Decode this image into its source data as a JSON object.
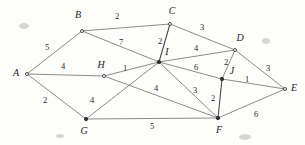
{
  "figure": {
    "width": 305,
    "height": 145,
    "background_color": "#fdfdfc",
    "edge_color": "#5a5a5a",
    "label_color": "#1c1c1c"
  },
  "chart_data": {
    "type": "diagram",
    "diagram_type": "weighted-undirected-graph",
    "title": "",
    "node_count": 10,
    "edge_count": 19,
    "nodes": [
      {
        "id": "A",
        "label": "A",
        "x": 27,
        "y": 74,
        "label_x": 16,
        "label_y": 74,
        "marker": "hollow"
      },
      {
        "id": "B",
        "label": "B",
        "x": 82,
        "y": 31,
        "label_x": 78,
        "label_y": 16,
        "marker": "hollow"
      },
      {
        "id": "C",
        "label": "C",
        "x": 170,
        "y": 24,
        "label_x": 172,
        "label_y": 12,
        "marker": "hollow"
      },
      {
        "id": "D",
        "label": "D",
        "x": 235,
        "y": 50,
        "label_x": 240,
        "label_y": 39,
        "marker": "hollow"
      },
      {
        "id": "E",
        "label": "E",
        "x": 285,
        "y": 89,
        "label_x": 294,
        "label_y": 89,
        "marker": "hollow"
      },
      {
        "id": "F",
        "label": "F",
        "x": 218,
        "y": 118,
        "label_x": 219,
        "label_y": 131,
        "marker": "solid"
      },
      {
        "id": "G",
        "label": "G",
        "x": 86,
        "y": 119,
        "label_x": 84,
        "label_y": 132,
        "marker": "solid"
      },
      {
        "id": "H",
        "label": "H",
        "x": 104,
        "y": 76,
        "label_x": 101,
        "label_y": 66,
        "marker": "hollow"
      },
      {
        "id": "I",
        "label": "I",
        "x": 159,
        "y": 62,
        "label_x": 167,
        "label_y": 53,
        "marker": "solid"
      },
      {
        "id": "J",
        "label": "J",
        "x": 222,
        "y": 79,
        "label_x": 232,
        "label_y": 72,
        "marker": "solid"
      }
    ],
    "edges": [
      {
        "from": "A",
        "to": "B",
        "weight": 5,
        "label_x": 47,
        "label_y": 48,
        "thick": false
      },
      {
        "from": "A",
        "to": "H",
        "weight": 4,
        "label_x": 63,
        "label_y": 67,
        "thick": false
      },
      {
        "from": "A",
        "to": "G",
        "weight": 2,
        "label_x": 45,
        "label_y": 101,
        "thick": false
      },
      {
        "from": "B",
        "to": "C",
        "weight": 2,
        "label_x": 117,
        "label_y": 17,
        "thick": false
      },
      {
        "from": "B",
        "to": "I",
        "weight": 7,
        "label_x": 121,
        "label_y": 43,
        "thick": false
      },
      {
        "from": "C",
        "to": "I",
        "weight": 2,
        "label_x": 160,
        "label_y": 42,
        "thick": true
      },
      {
        "from": "C",
        "to": "D",
        "weight": 3,
        "label_x": 202,
        "label_y": 28,
        "thick": false
      },
      {
        "from": "I",
        "to": "D",
        "weight": 4,
        "label_x": 196,
        "label_y": 49,
        "thick": false
      },
      {
        "from": "I",
        "to": "J",
        "weight": 6,
        "label_x": 196,
        "label_y": 68,
        "thick": false
      },
      {
        "from": "I",
        "to": "F",
        "weight": 3,
        "label_x": 195,
        "label_y": 91,
        "thick": false
      },
      {
        "from": "I",
        "to": "G",
        "weight": 4,
        "label_x": 92,
        "label_y": 101,
        "thick": false
      },
      {
        "from": "H",
        "to": "I",
        "weight": 1,
        "label_x": 125,
        "label_y": 69,
        "thick": false
      },
      {
        "from": "H",
        "to": "F",
        "weight": 4,
        "label_x": 156,
        "label_y": 89,
        "thick": false
      },
      {
        "from": "D",
        "to": "J",
        "weight": 2,
        "label_x": 226,
        "label_y": 63,
        "thick": false
      },
      {
        "from": "D",
        "to": "E",
        "weight": 3,
        "label_x": 268,
        "label_y": 69,
        "thick": false
      },
      {
        "from": "J",
        "to": "E",
        "weight": 1,
        "label_x": 247,
        "label_y": 80,
        "thick": false
      },
      {
        "from": "J",
        "to": "F",
        "weight": 2,
        "label_x": 213,
        "label_y": 99,
        "thick": true
      },
      {
        "from": "G",
        "to": "F",
        "weight": 5,
        "label_x": 152,
        "label_y": 127,
        "thick": false
      },
      {
        "from": "F",
        "to": "E",
        "weight": 6,
        "label_x": 256,
        "label_y": 115,
        "thick": false
      }
    ]
  }
}
